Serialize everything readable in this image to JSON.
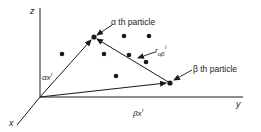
{
  "diagram": {
    "title": "",
    "colors": {
      "ink": "#1a1a1a",
      "background": "#ffffff"
    },
    "origin": [
      40,
      97
    ],
    "axes": [
      {
        "name": "z",
        "label": "z",
        "from": [
          40,
          97
        ],
        "to": [
          40,
          8
        ]
      },
      {
        "name": "y",
        "label": "y",
        "from": [
          40,
          97
        ],
        "to": [
          243,
          97
        ]
      },
      {
        "name": "x",
        "label": "x",
        "from": [
          40,
          97
        ],
        "to": [
          17,
          125
        ]
      }
    ],
    "particles": {
      "alpha": {
        "label": "α th particle",
        "position": [
          94,
          37
        ]
      },
      "beta": {
        "label": "β th particle",
        "position": [
          170,
          83
        ]
      },
      "others": [
        [
          62,
          54
        ],
        [
          124,
          36
        ],
        [
          149,
          36
        ],
        [
          104,
          54
        ],
        [
          129,
          55
        ],
        [
          146,
          62
        ],
        [
          116,
          76
        ]
      ]
    },
    "vectors": {
      "alpha_position": {
        "prefix": "α",
        "symbol": "x",
        "superscript": "i",
        "from": [
          40,
          97
        ],
        "to": [
          94,
          37
        ]
      },
      "beta_position": {
        "prefix": "β",
        "symbol": "x",
        "superscript": "i",
        "from": [
          40,
          97
        ],
        "to": [
          170,
          83
        ]
      },
      "relative": {
        "symbol": "r",
        "subscript": "αβ",
        "superscript": "i",
        "from": [
          170,
          83
        ],
        "to": [
          94,
          37
        ]
      }
    },
    "labels": {
      "z": "z",
      "y": "y",
      "x": "x",
      "alpha_particle": "α th particle",
      "beta_particle": "β th particle",
      "alpha_x_prefix": "α",
      "alpha_x_symbol": "x",
      "alpha_x_sup": "i",
      "beta_x_prefix": "β",
      "beta_x_symbol": "x",
      "beta_x_sup": "i",
      "r_symbol": "r",
      "r_sub": "αβ",
      "r_sup": "i"
    }
  }
}
